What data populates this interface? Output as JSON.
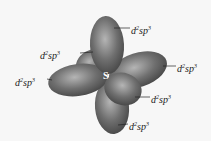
{
  "diagram": {
    "center_atom": "S",
    "colors": {
      "lobe": "#6f6f6f",
      "lobe_light": "#b5b5b5",
      "lobe_dark": "#444444",
      "background": "#f7f7f7"
    },
    "labels": [
      {
        "base": "d",
        "sup1": "2",
        "mid": "sp",
        "sup2": "3"
      },
      {
        "base": "d",
        "sup1": "2",
        "mid": "sp",
        "sup2": "3"
      },
      {
        "base": "d",
        "sup1": "2",
        "mid": "sp",
        "sup2": "3"
      },
      {
        "base": "d",
        "sup1": "2",
        "mid": "sp",
        "sup2": "3"
      },
      {
        "base": "d",
        "sup1": "2",
        "mid": "sp",
        "sup2": "3"
      },
      {
        "base": "d",
        "sup1": "2",
        "mid": "sp",
        "sup2": "3"
      }
    ]
  }
}
